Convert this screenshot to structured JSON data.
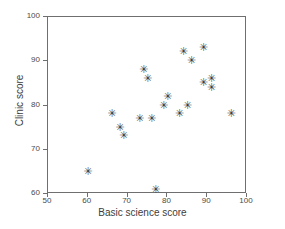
{
  "chart_data": {
    "type": "scatter",
    "title": "",
    "xlabel": "Basic science score",
    "ylabel": "Clinic score",
    "xlim": [
      50,
      100
    ],
    "ylim": [
      60,
      100
    ],
    "xticks": [
      50,
      60,
      70,
      80,
      90,
      100
    ],
    "yticks": [
      60,
      70,
      80,
      90,
      100
    ],
    "grid": false,
    "legend": null,
    "marker": "asterisk",
    "marker_glyph": "✳",
    "marker_color": "#3a3a3a",
    "axis_color": "#6f6f6f",
    "points": [
      {
        "x": 60,
        "y": 65
      },
      {
        "x": 66,
        "y": 78
      },
      {
        "x": 68,
        "y": 75
      },
      {
        "x": 69,
        "y": 73
      },
      {
        "x": 73,
        "y": 77
      },
      {
        "x": 74,
        "y": 88
      },
      {
        "x": 75,
        "y": 86
      },
      {
        "x": 76,
        "y": 77
      },
      {
        "x": 77,
        "y": 61
      },
      {
        "x": 79,
        "y": 80
      },
      {
        "x": 80,
        "y": 82
      },
      {
        "x": 83,
        "y": 78
      },
      {
        "x": 84,
        "y": 92
      },
      {
        "x": 85,
        "y": 80
      },
      {
        "x": 86,
        "y": 90
      },
      {
        "x": 89,
        "y": 93
      },
      {
        "x": 89,
        "y": 85
      },
      {
        "x": 91,
        "y": 86
      },
      {
        "x": 91,
        "y": 84
      },
      {
        "x": 96,
        "y": 78
      }
    ],
    "xtick_labels": [
      "50",
      "60",
      "70",
      "80",
      "90",
      "100"
    ],
    "ytick_labels": [
      "60",
      "70",
      "80",
      "90",
      "100"
    ]
  }
}
